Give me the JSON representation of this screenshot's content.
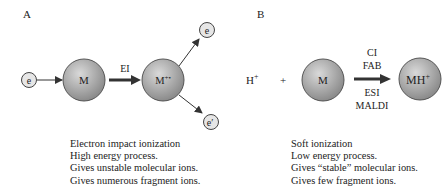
{
  "panel_a": {
    "label": "A",
    "electron_in": "e",
    "molecule": "M",
    "process": "EI",
    "ion_base": "M",
    "ion_charge": "+•",
    "electron_out_1": "e",
    "electron_out_2": "e",
    "electron_out_2_prime": "′",
    "description": [
      "Electron impact ionization",
      "High energy process.",
      "Gives unstable molecular ions.",
      "Gives numerous fragment ions."
    ]
  },
  "panel_b": {
    "label": "B",
    "proton_base": "H",
    "proton_charge": "+",
    "plus": "+",
    "molecule": "M",
    "methods_above": [
      "CI",
      "FAB"
    ],
    "methods_below": [
      "ESI",
      "MALDI"
    ],
    "product_base": "MH",
    "product_charge": "+",
    "description": [
      "Soft ionization",
      "Low energy process.",
      "Gives “stable” molecular ions.",
      "Gives few fragment ions."
    ]
  },
  "colors": {
    "sphere_light": "#d8d8d8",
    "sphere_dark": "#8a8a8a",
    "small_circle": "#e4e4e4",
    "stroke": "#333333"
  }
}
